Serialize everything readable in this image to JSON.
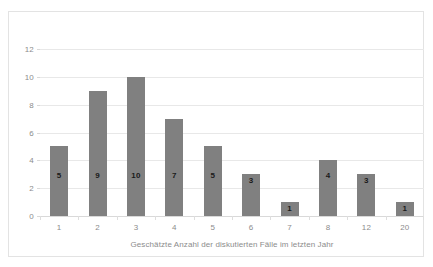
{
  "chart_data": {
    "type": "bar",
    "title": "",
    "subtitle": "",
    "xlabel": "Geschätzte Anzahl der diskutierten Fälle im letzten Jahr",
    "ylabel": "",
    "categories": [
      "1",
      "2",
      "3",
      "4",
      "5",
      "6",
      "7",
      "8",
      "12",
      "20"
    ],
    "values": [
      5,
      9,
      10,
      7,
      5,
      3,
      1,
      4,
      3,
      1
    ],
    "data_labels": [
      "5",
      "9",
      "10",
      "7",
      "5",
      "3",
      "1",
      "4",
      "3",
      "1"
    ],
    "ylim": [
      0,
      12
    ],
    "ytick_values": [
      0,
      2,
      4,
      6,
      8,
      10,
      12
    ],
    "ytick_labels": [
      "0",
      "2",
      "4",
      "6",
      "8",
      "10",
      "12"
    ],
    "grid": {
      "horizontal": true,
      "vertical": false
    },
    "legend": {
      "visible": false,
      "position": "none",
      "entries": []
    },
    "series": [
      {
        "name": "",
        "values": [
          5,
          9,
          10,
          7,
          5,
          3,
          1,
          4,
          3,
          1
        ]
      }
    ],
    "annotations": []
  },
  "style": {
    "bar_color": "#808080",
    "gridline_color": "#e8e8e8",
    "axis_line_color": "#d9d9d9",
    "tick_text_color": "#8c8c8c",
    "data_label_color": "#1a1a1a",
    "plot_background": "#ffffff",
    "frame_border_color": "#e3e3e3"
  }
}
